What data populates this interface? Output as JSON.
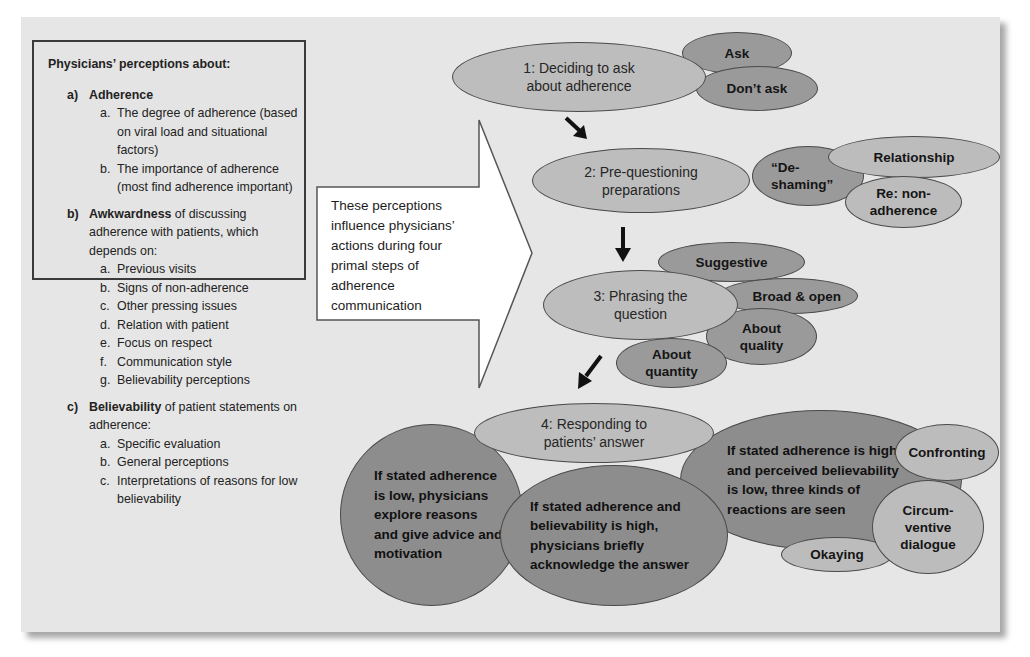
{
  "left_box": {
    "title": "Physicians’ perceptions about:",
    "sections": [
      {
        "letter": "a)",
        "heading_bold": "Adherence",
        "heading_rest": "",
        "items": [
          {
            "letter": "a.",
            "text": "The degree of adherence (based on viral load and situational factors)"
          },
          {
            "letter": "b.",
            "text": "The importance of adherence (most find adherence important)"
          }
        ]
      },
      {
        "letter": "b)",
        "heading_bold": "Awkwardness",
        "heading_rest": " of discussing adherence with patients, which depends on:",
        "items": [
          {
            "letter": "a.",
            "text": "Previous visits"
          },
          {
            "letter": "b.",
            "text": "Signs of non-adherence"
          },
          {
            "letter": "c.",
            "text": "Other pressing issues"
          },
          {
            "letter": "d.",
            "text": "Relation with patient"
          },
          {
            "letter": "e.",
            "text": "Focus on respect"
          },
          {
            "letter": "f.",
            "text": "Communication style"
          },
          {
            "letter": "g.",
            "text": "Believability perceptions"
          }
        ]
      },
      {
        "letter": "c)",
        "heading_bold": "Believability",
        "heading_rest": " of patient statements on adherence:",
        "items": [
          {
            "letter": "a.",
            "text": "Specific evaluation"
          },
          {
            "letter": "b.",
            "text": "General perceptions"
          },
          {
            "letter": "c.",
            "text": "Interpretations of reasons for low believability"
          }
        ]
      }
    ]
  },
  "arrow_text": "These perceptions influence physicians’ actions during four primal steps of adherence communication",
  "steps": {
    "step1": {
      "label": "1: Deciding to ask about adherence",
      "options": [
        "Ask",
        "Don’t ask"
      ]
    },
    "step2": {
      "label": "2: Pre-questioning preparations",
      "options": [
        "“De-shaming”",
        "Relationship",
        "Re: non-adherence"
      ]
    },
    "step3": {
      "label": "3: Phrasing the question",
      "options": [
        "Suggestive",
        "Broad & open",
        "About quality",
        "About quantity"
      ]
    },
    "step4": {
      "label": "4: Responding to patients’ answer",
      "responses": [
        "If stated adherence is low, physicians explore reasons and give advice and motivation",
        "If stated adherence and believability is high, physicians briefly acknowledge the answer",
        "If stated adherence is high and perceived believability is low, three kinds of reactions are seen"
      ],
      "reactions": [
        "Confronting",
        "Circum-ventive dialogue",
        "Okaying"
      ]
    }
  },
  "colors": {
    "panel_bg": "#e6e6e6",
    "step_fill": "#bdbdbd",
    "option_fill": "#9a9a9a",
    "response_fill": "#8d8d8d",
    "outline": "#4a4a4a"
  }
}
